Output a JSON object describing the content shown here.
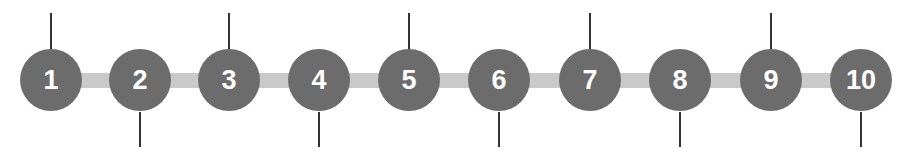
{
  "diagram": {
    "type": "timeline",
    "colors": {
      "node": "#6c6c6c",
      "connector": "#c9c9c9",
      "tick": "#333333",
      "label": "#ffffff"
    },
    "nodes": [
      {
        "label": "1",
        "cx": 51,
        "tick": "up"
      },
      {
        "label": "2",
        "cx": 140,
        "tick": "down"
      },
      {
        "label": "3",
        "cx": 229,
        "tick": "up"
      },
      {
        "label": "4",
        "cx": 319,
        "tick": "down"
      },
      {
        "label": "5",
        "cx": 409,
        "tick": "up"
      },
      {
        "label": "6",
        "cx": 499,
        "tick": "down"
      },
      {
        "label": "7",
        "cx": 590,
        "tick": "up"
      },
      {
        "label": "8",
        "cx": 680,
        "tick": "down"
      },
      {
        "label": "9",
        "cx": 771,
        "tick": "up"
      },
      {
        "label": "10",
        "cx": 861,
        "tick": "down"
      }
    ]
  }
}
